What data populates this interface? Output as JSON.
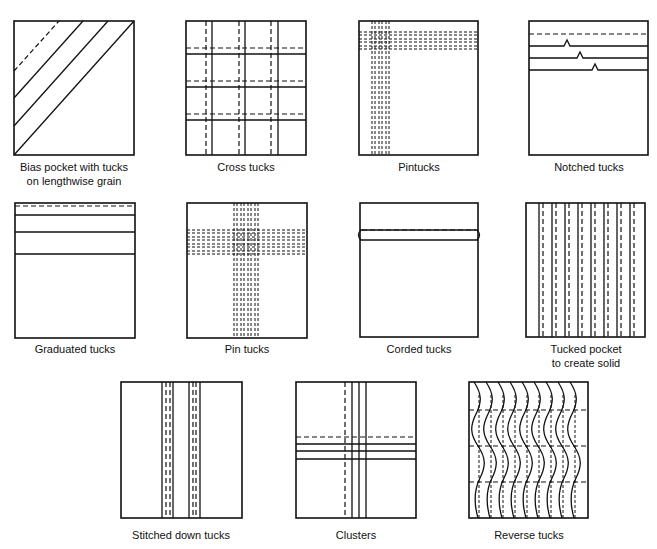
{
  "colors": {
    "line": "#111111",
    "background": "#ffffff"
  },
  "diagrams": [
    {
      "id": "bias-pocket",
      "caption_line1": "Bias pocket with tucks",
      "caption_line2": "on lengthwise grain"
    },
    {
      "id": "cross-tucks",
      "caption_line1": "Cross tucks",
      "caption_line2": ""
    },
    {
      "id": "pintucks",
      "caption_line1": "Pintucks",
      "caption_line2": ""
    },
    {
      "id": "notched-tucks",
      "caption_line1": "Notched tucks",
      "caption_line2": ""
    },
    {
      "id": "graduated-tucks",
      "caption_line1": "Graduated tucks",
      "caption_line2": ""
    },
    {
      "id": "pin-tucks",
      "caption_line1": "Pin tucks",
      "caption_line2": ""
    },
    {
      "id": "corded-tucks",
      "caption_line1": "Corded tucks",
      "caption_line2": ""
    },
    {
      "id": "tucked-pocket",
      "caption_line1": "Tucked pocket",
      "caption_line2": "to create solid"
    },
    {
      "id": "stitched-down-tucks",
      "caption_line1": "Stitched down tucks",
      "caption_line2": ""
    },
    {
      "id": "clusters",
      "caption_line1": "Clusters",
      "caption_line2": ""
    },
    {
      "id": "reverse-tucks",
      "caption_line1": "Reverse tucks",
      "caption_line2": ""
    }
  ]
}
